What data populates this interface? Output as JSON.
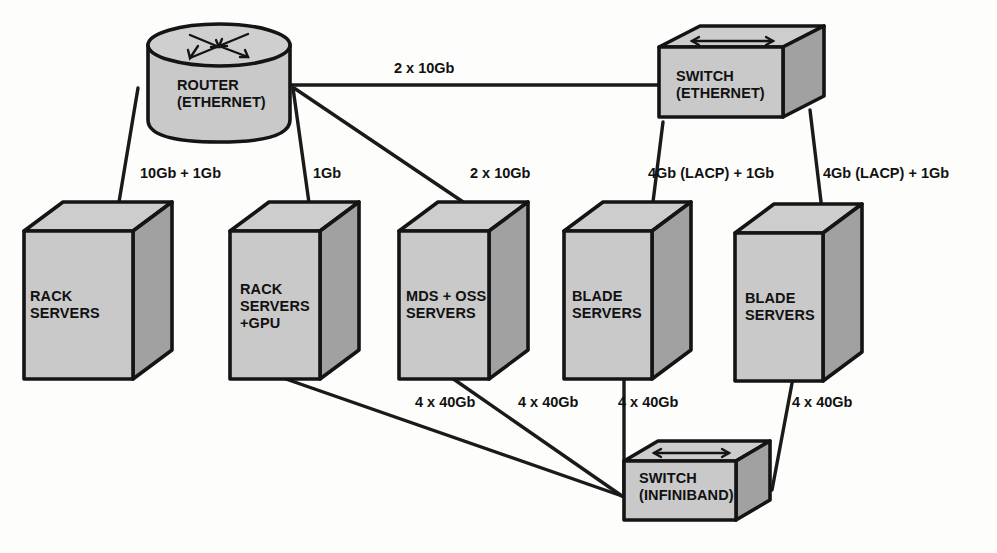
{
  "diagram": {
    "colors": {
      "front_face": "#c9c9c9",
      "top_face": "#cdcdcd",
      "side_face": "#a1a1a1",
      "outline": "#141414",
      "link": "#1a1a1a",
      "background": "#fdfdfb"
    },
    "nodes": [
      {
        "id": "router-ethernet",
        "shape": "cylinder",
        "icon": "router-arrows-icon",
        "label_lines": [
          "ROUTER",
          "(ETHERNET)"
        ],
        "label_left": 177,
        "label_top": 77
      },
      {
        "id": "switch-ethernet",
        "shape": "box3d",
        "icon": "switch-arrows-icon",
        "label_lines": [
          "SWITCH",
          "(ETHERNET)"
        ],
        "label_left": 676,
        "label_top": 68
      },
      {
        "id": "switch-infiniband",
        "shape": "box3d",
        "icon": "switch-arrows-icon",
        "label_lines": [
          "SWITCH",
          "(INFINIBAND)"
        ],
        "label_left": 639,
        "label_top": 470
      },
      {
        "id": "rack-servers",
        "shape": "cube",
        "label_lines": [
          "RACK",
          "SERVERS"
        ],
        "label_left": 30,
        "label_top": 288
      },
      {
        "id": "rack-servers-gpu",
        "shape": "cube",
        "label_lines": [
          "RACK",
          "SERVERS",
          "+GPU"
        ],
        "label_left": 240,
        "label_top": 281
      },
      {
        "id": "mds-oss-servers",
        "shape": "cube",
        "label_lines": [
          "MDS + OSS",
          "SERVERS"
        ],
        "label_left": 406,
        "label_top": 288
      },
      {
        "id": "blade-servers-1",
        "shape": "cube",
        "label_lines": [
          "BLADE",
          "SERVERS"
        ],
        "label_left": 572,
        "label_top": 288
      },
      {
        "id": "blade-servers-2",
        "shape": "cube",
        "label_lines": [
          "BLADE",
          "SERVERS"
        ],
        "label_left": 745,
        "label_top": 290
      }
    ],
    "links": [
      {
        "id": "router-to-switch-ethernet",
        "from": "router-ethernet",
        "to": "switch-ethernet",
        "label": "2 x 10Gb",
        "label_left": 394,
        "label_top": 60
      },
      {
        "id": "router-to-rack-servers",
        "from": "router-ethernet",
        "to": "rack-servers",
        "label": "10Gb + 1Gb",
        "label_left": 140,
        "label_top": 165
      },
      {
        "id": "router-to-rack-servers-gpu",
        "from": "router-ethernet",
        "to": "rack-servers-gpu",
        "label": "1Gb",
        "label_left": 313,
        "label_top": 165
      },
      {
        "id": "router-to-mds-oss",
        "from": "router-ethernet",
        "to": "mds-oss-servers",
        "label": "2 x 10Gb",
        "label_left": 470,
        "label_top": 165
      },
      {
        "id": "switch-ethernet-to-blade-1",
        "from": "switch-ethernet",
        "to": "blade-servers-1",
        "label": "4Gb (LACP) + 1Gb",
        "label_left": 648,
        "label_top": 165
      },
      {
        "id": "switch-ethernet-to-blade-2",
        "from": "switch-ethernet",
        "to": "blade-servers-2",
        "label": "4Gb (LACP) + 1Gb",
        "label_left": 823,
        "label_top": 165
      },
      {
        "id": "rack-gpu-to-infiniband",
        "from": "rack-servers-gpu",
        "to": "switch-infiniband",
        "label": "4 x 40Gb",
        "label_left": 415,
        "label_top": 394
      },
      {
        "id": "mds-oss-to-infiniband",
        "from": "mds-oss-servers",
        "to": "switch-infiniband",
        "label": "4 x 40Gb",
        "label_left": 518,
        "label_top": 394
      },
      {
        "id": "blade-1-to-infiniband",
        "from": "blade-servers-1",
        "to": "switch-infiniband",
        "label": "4 x 40Gb",
        "label_left": 618,
        "label_top": 394
      },
      {
        "id": "blade-2-to-infiniband",
        "from": "blade-servers-2",
        "to": "switch-infiniband",
        "label": "4 x 40Gb",
        "label_left": 792,
        "label_top": 394
      }
    ]
  }
}
